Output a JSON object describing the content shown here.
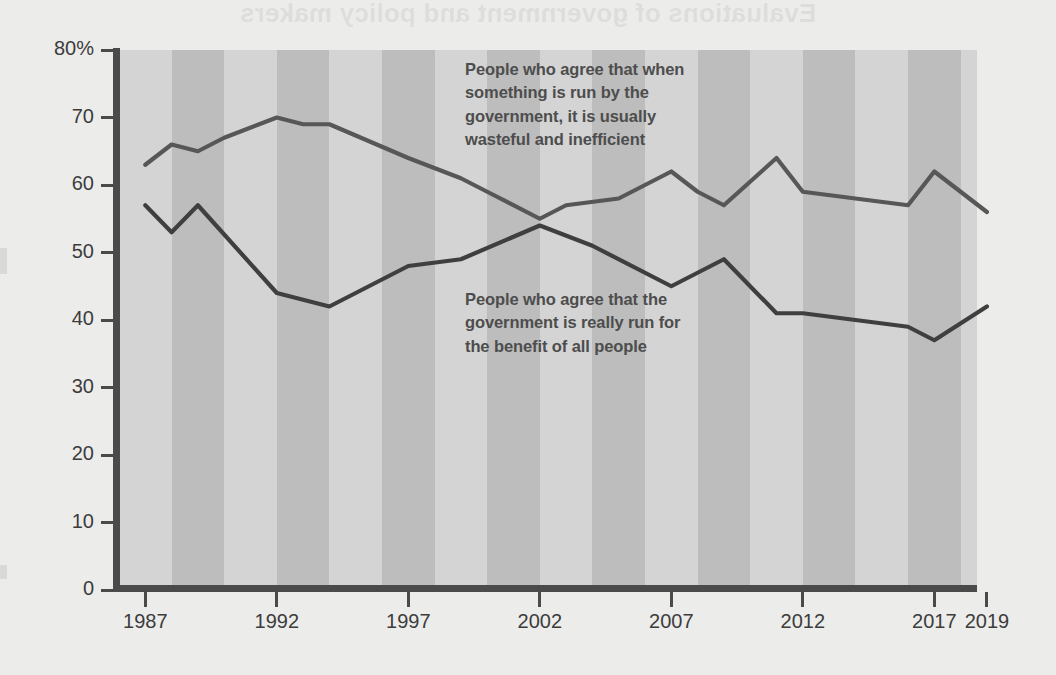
{
  "page": {
    "background_color": "#ececeb",
    "ghost_title": "Evaluations of government and policy makers",
    "ghost_body": "this faint reversed text shows through from the reverse side of the printed page"
  },
  "axes": {
    "y_ticks": [
      "80%",
      "70",
      "60",
      "50",
      "40",
      "30",
      "20",
      "10",
      "0"
    ],
    "y_values": [
      80,
      70,
      60,
      50,
      40,
      30,
      20,
      10,
      0
    ],
    "x_ticks": [
      "1987",
      "1992",
      "1997",
      "2002",
      "2007",
      "2012",
      "2017",
      "2019"
    ],
    "x_values": [
      1987,
      1992,
      1997,
      2002,
      2007,
      2012,
      2017,
      2019
    ],
    "axis_color": "#4a4a4a",
    "label_color": "#3c3c3c"
  },
  "annotations": [
    {
      "id": "wasteful",
      "text": "People who agree that when\nsomething is run by the\ngovernment, it is usually\nwasteful and inefficient",
      "color": "#4d4d4d"
    },
    {
      "id": "benefit",
      "text": "People who agree that the\ngovernment is really run for\nthe benefit of all people",
      "color": "#4d4d4d"
    }
  ],
  "bands": {
    "light_color": "#d4d4d4",
    "dark_color": "#bdbdbd",
    "period_years": 2,
    "start_year": 1986
  },
  "chart_data": {
    "type": "line",
    "title": "Evaluations of government and policy makers",
    "xlabel": "",
    "ylabel": "",
    "xlim": [
      1986,
      2019
    ],
    "ylim": [
      0,
      80
    ],
    "grid": false,
    "legend": "inline-annotations",
    "series": [
      {
        "name": "People who agree that when something is run by the government, it is usually wasteful and inefficient",
        "short_name": "wasteful and inefficient",
        "color": "#575757",
        "x": [
          1987,
          1988,
          1989,
          1990,
          1992,
          1993,
          1994,
          1997,
          1999,
          2000,
          2002,
          2003,
          2005,
          2007,
          2008,
          2009,
          2011,
          2012,
          2014,
          2016,
          2017,
          2019
        ],
        "values": [
          63,
          66,
          65,
          67,
          70,
          69,
          69,
          64,
          61,
          59,
          55,
          57,
          58,
          62,
          59,
          57,
          64,
          59,
          58,
          57,
          62,
          56
        ]
      },
      {
        "name": "People who agree that the government is really run for the benefit of all people",
        "short_name": "benefit of all people",
        "color": "#3f3f3f",
        "x": [
          1987,
          1988,
          1989,
          1992,
          1994,
          1997,
          1999,
          2002,
          2004,
          2007,
          2009,
          2011,
          2012,
          2016,
          2017,
          2019
        ],
        "values": [
          57,
          53,
          57,
          44,
          42,
          48,
          49,
          54,
          51,
          45,
          49,
          41,
          41,
          39,
          37,
          42
        ]
      }
    ]
  }
}
